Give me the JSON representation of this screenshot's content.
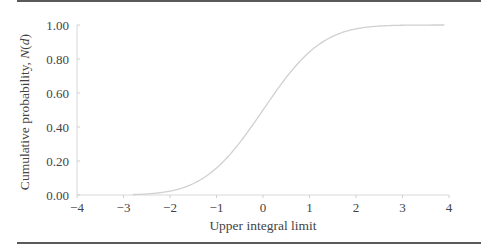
{
  "chart_data": {
    "type": "line",
    "title": "",
    "xlabel": "Upper integral limit",
    "ylabel": "Cumulative probability, N(d)",
    "xlim": [
      -4,
      4
    ],
    "ylim": [
      0,
      1
    ],
    "x_ticks": [
      "−4",
      "−3",
      "−2",
      "−1",
      "0",
      "1",
      "2",
      "3",
      "4"
    ],
    "y_ticks": [
      "0.00",
      "0.20",
      "0.40",
      "0.60",
      "0.80",
      "1.00"
    ],
    "grid": false,
    "legend": null,
    "series": [
      {
        "name": "Standard normal CDF N(d)",
        "color": "#d0d0d0",
        "x": [
          -2.8,
          -2.5,
          -2.0,
          -1.5,
          -1.0,
          -0.5,
          0.0,
          0.5,
          1.0,
          1.5,
          2.0,
          2.5,
          3.0,
          3.5,
          3.9
        ],
        "values": [
          0.003,
          0.006,
          0.023,
          0.067,
          0.159,
          0.309,
          0.5,
          0.691,
          0.841,
          0.933,
          0.977,
          0.994,
          0.999,
          1.0,
          1.0
        ]
      }
    ]
  },
  "labels": {
    "xlabel": "Upper integral limit",
    "ylabel_prefix": "Cumulative probability, ",
    "ylabel_var": "N",
    "ylabel_paren_open": "(",
    "ylabel_arg": "d",
    "ylabel_paren_close": ")"
  }
}
